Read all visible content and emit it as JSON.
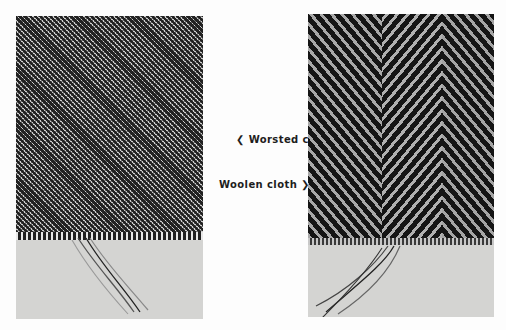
{
  "figures": [
    {
      "id": "left",
      "subject": "Worsted cloth sample",
      "weave": "fine twill"
    },
    {
      "id": "right",
      "subject": "Woolen cloth sample",
      "weave": "herringbone twill"
    }
  ],
  "captions": {
    "worsted": {
      "arrow": "❮",
      "label": "Worsted cloth"
    },
    "woolen": {
      "label": "Woolen cloth",
      "arrow": "❯"
    }
  }
}
